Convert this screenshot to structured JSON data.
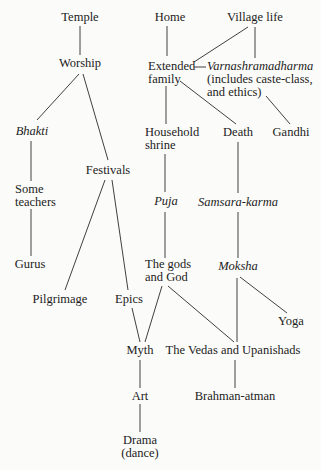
{
  "diagram": {
    "nodes": [
      {
        "id": "temple",
        "lines": [
          "Temple"
        ],
        "italic": false
      },
      {
        "id": "home",
        "lines": [
          "Home"
        ],
        "italic": false
      },
      {
        "id": "village-life",
        "lines": [
          "Village life"
        ],
        "italic": false
      },
      {
        "id": "worship",
        "lines": [
          "Worship"
        ],
        "italic": false
      },
      {
        "id": "extended-family",
        "lines": [
          "Extended",
          "family"
        ],
        "italic": false
      },
      {
        "id": "varnashramadharma",
        "lines": [
          "Varnashramadharma",
          "(includes caste-class,",
          "and ethics)"
        ],
        "italic_first_line": true
      },
      {
        "id": "bhakti",
        "lines": [
          "Bhakti"
        ],
        "italic": true
      },
      {
        "id": "household-shrine",
        "lines": [
          "Household",
          "shrine"
        ],
        "italic": false
      },
      {
        "id": "death",
        "lines": [
          "Death"
        ],
        "italic": false
      },
      {
        "id": "gandhi",
        "lines": [
          "Gandhi"
        ],
        "italic": false
      },
      {
        "id": "festivals",
        "lines": [
          "Festivals"
        ],
        "italic": false
      },
      {
        "id": "some-teachers",
        "lines": [
          "Some",
          "teachers"
        ],
        "italic": false
      },
      {
        "id": "puja",
        "lines": [
          "Puja"
        ],
        "italic": true
      },
      {
        "id": "samsara-karma",
        "lines": [
          "Samsara-karma"
        ],
        "italic": true
      },
      {
        "id": "gurus",
        "lines": [
          "Gurus"
        ],
        "italic": false
      },
      {
        "id": "gods-and-god",
        "lines": [
          "The gods",
          "and God"
        ],
        "italic": false
      },
      {
        "id": "moksha",
        "lines": [
          "Moksha"
        ],
        "italic": true
      },
      {
        "id": "pilgrimage",
        "lines": [
          "Pilgrimage"
        ],
        "italic": false
      },
      {
        "id": "epics",
        "lines": [
          "Epics"
        ],
        "italic": false
      },
      {
        "id": "yoga",
        "lines": [
          "Yoga"
        ],
        "italic": false
      },
      {
        "id": "myth",
        "lines": [
          "Myth"
        ],
        "italic": false
      },
      {
        "id": "vedas-upanishads",
        "lines": [
          "The Vedas and Upanishads"
        ],
        "italic": false
      },
      {
        "id": "art",
        "lines": [
          "Art"
        ],
        "italic": false
      },
      {
        "id": "brahman-atman",
        "lines": [
          "Brahman-atman"
        ],
        "italic": false
      },
      {
        "id": "drama-dance",
        "lines": [
          "Drama",
          "(dance)"
        ],
        "italic": false
      }
    ],
    "edges": [
      [
        "temple",
        "worship"
      ],
      [
        "worship",
        "bhakti"
      ],
      [
        "worship",
        "festivals"
      ],
      [
        "bhakti",
        "some-teachers"
      ],
      [
        "some-teachers",
        "gurus"
      ],
      [
        "festivals",
        "pilgrimage"
      ],
      [
        "festivals",
        "epics"
      ],
      [
        "home",
        "extended-family"
      ],
      [
        "village-life",
        "extended-family"
      ],
      [
        "village-life",
        "varnashramadharma"
      ],
      [
        "extended-family",
        "varnashramadharma"
      ],
      [
        "extended-family",
        "household-shrine"
      ],
      [
        "extended-family",
        "death"
      ],
      [
        "varnashramadharma",
        "gandhi"
      ],
      [
        "household-shrine",
        "puja"
      ],
      [
        "puja",
        "gods-and-god"
      ],
      [
        "death",
        "samsara-karma"
      ],
      [
        "samsara-karma",
        "moksha"
      ],
      [
        "moksha",
        "yoga"
      ],
      [
        "moksha",
        "vedas-upanishads"
      ],
      [
        "gods-and-god",
        "myth"
      ],
      [
        "gods-and-god",
        "vedas-upanishads"
      ],
      [
        "epics",
        "myth"
      ],
      [
        "myth",
        "art"
      ],
      [
        "art",
        "drama-dance"
      ],
      [
        "vedas-upanishads",
        "brahman-atman"
      ]
    ]
  }
}
